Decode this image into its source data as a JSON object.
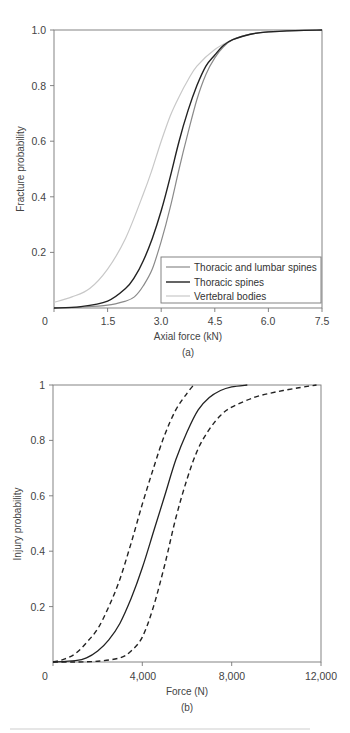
{
  "chart_data": [
    {
      "type": "line",
      "panel_label": "(a)",
      "title": "",
      "xlabel": "Axial force (kN)",
      "ylabel": "Fracture probability",
      "xlim": [
        0,
        7.5
      ],
      "ylim": [
        0,
        1.0
      ],
      "x_ticks": [
        "0",
        "1.5",
        "3.0",
        "4.5",
        "6.0",
        "7.5"
      ],
      "y_ticks": [
        "0.2",
        "0.4",
        "0.6",
        "0.8",
        "1.0"
      ],
      "grid": false,
      "legend_position": "lower right",
      "series": [
        {
          "name": "Thoracic and lumbar spines",
          "color": "#8a8a8a",
          "x": [
            0,
            0.75,
            1.5,
            2.0,
            2.25,
            2.5,
            2.75,
            3.0,
            3.25,
            3.5,
            3.75,
            4.0,
            4.25,
            4.5,
            4.75,
            5.0,
            5.5,
            6.0,
            6.75,
            7.5
          ],
          "y": [
            0.0,
            0.003,
            0.01,
            0.025,
            0.04,
            0.08,
            0.14,
            0.24,
            0.36,
            0.5,
            0.63,
            0.75,
            0.84,
            0.9,
            0.94,
            0.965,
            0.985,
            0.993,
            0.998,
            1.0
          ]
        },
        {
          "name": "Thoracic spines",
          "color": "#222222",
          "x": [
            0,
            0.75,
            1.5,
            2.0,
            2.25,
            2.5,
            2.75,
            3.0,
            3.25,
            3.5,
            3.75,
            4.0,
            4.25,
            4.5,
            4.75,
            5.0,
            5.5,
            6.0,
            6.75,
            7.5
          ],
          "y": [
            0.0,
            0.005,
            0.025,
            0.07,
            0.11,
            0.17,
            0.25,
            0.35,
            0.47,
            0.6,
            0.71,
            0.8,
            0.87,
            0.91,
            0.945,
            0.965,
            0.985,
            0.993,
            0.998,
            1.0
          ]
        },
        {
          "name": "Vertebral bodies",
          "color": "#c8c8c8",
          "x": [
            0,
            0.5,
            1.0,
            1.5,
            2.0,
            2.5,
            2.75,
            3.0,
            3.25,
            3.5,
            3.75,
            4.0,
            4.5,
            5.0,
            5.5,
            6.0,
            6.75,
            7.5
          ],
          "y": [
            0.02,
            0.04,
            0.07,
            0.14,
            0.25,
            0.41,
            0.5,
            0.6,
            0.69,
            0.76,
            0.82,
            0.87,
            0.93,
            0.965,
            0.985,
            0.993,
            0.998,
            1.0
          ]
        }
      ]
    },
    {
      "type": "line",
      "panel_label": "(b)",
      "title": "",
      "xlabel": "Force (N)",
      "ylabel": "Injury probability",
      "xlim": [
        0,
        12000
      ],
      "ylim": [
        0,
        1
      ],
      "x_ticks": [
        "0",
        "4,000",
        "8,000",
        "12,000"
      ],
      "y_ticks": [
        "0.2",
        "0.4",
        "0.6",
        "0.8",
        "1"
      ],
      "grid": false,
      "legend": false,
      "series": [
        {
          "name": "Lower bound (dashed)",
          "style": "dashed",
          "color": "#222222",
          "x": [
            0,
            500,
            1000,
            1500,
            2000,
            2500,
            3000,
            3500,
            4000,
            4500,
            5000,
            5500,
            6000,
            6300
          ],
          "y": [
            0.0,
            0.01,
            0.03,
            0.07,
            0.12,
            0.2,
            0.3,
            0.43,
            0.57,
            0.7,
            0.82,
            0.91,
            0.97,
            1.0
          ]
        },
        {
          "name": "Mean (solid)",
          "style": "solid",
          "color": "#222222",
          "x": [
            0,
            1000,
            1500,
            2000,
            2500,
            3000,
            3500,
            4000,
            4500,
            5000,
            5500,
            6000,
            6500,
            7000,
            7500,
            8000,
            8700
          ],
          "y": [
            0.0,
            0.005,
            0.015,
            0.04,
            0.08,
            0.14,
            0.23,
            0.34,
            0.47,
            0.6,
            0.73,
            0.83,
            0.91,
            0.955,
            0.98,
            0.993,
            1.0
          ]
        },
        {
          "name": "Upper bound (dashed)",
          "style": "dashed",
          "color": "#222222",
          "x": [
            0,
            1000,
            2000,
            3000,
            3500,
            4000,
            4500,
            5000,
            5500,
            6000,
            6500,
            7000,
            7500,
            8000,
            9000,
            10000,
            11000,
            11800
          ],
          "y": [
            0.0,
            0.0,
            0.003,
            0.015,
            0.04,
            0.09,
            0.2,
            0.35,
            0.52,
            0.66,
            0.77,
            0.84,
            0.89,
            0.92,
            0.955,
            0.975,
            0.99,
            1.0
          ]
        }
      ]
    }
  ],
  "figure": {
    "a_label": "(a)",
    "b_label": "(b)",
    "caption_fragment": "...a) fracture probability..."
  }
}
